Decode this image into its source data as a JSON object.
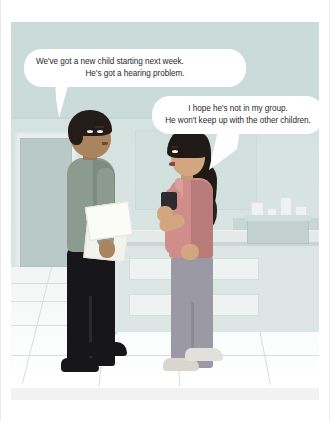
{
  "scene": {
    "title": "Two teachers talking in a staff room",
    "type": "illustration-comic-panel",
    "setting": "school staff room with counter, cabinet drawers, notice board and tiled floor"
  },
  "speech_bubbles": [
    {
      "id": "bubble-1",
      "speaker": "man",
      "tail_direction": "down-left",
      "lines": [
        "We've got a new child starting next week.",
        "He's got a hearing problem."
      ]
    },
    {
      "id": "bubble-2",
      "speaker": "woman",
      "tail_direction": "down-left",
      "lines": [
        "I hope he's not in my group.",
        "He won't keep up with the other children."
      ]
    }
  ],
  "characters": [
    {
      "id": "man",
      "description": "man facing right",
      "hair": "short dark",
      "top": "grey-green long sleeve shirt",
      "bottom": "black trousers",
      "shoes": "black shoes",
      "holding": "sheets of white paper"
    },
    {
      "id": "woman",
      "description": "woman facing left",
      "hair": "dark with fringe and ponytail",
      "top": "dusty pink sleeveless top",
      "bottom": "grey-purple trousers",
      "shoes": "light grey shoes",
      "holding": "dark coffee mug"
    }
  ],
  "background": {
    "wall_color": "#d4e2e0",
    "floor": "white tiled floor with grid lines",
    "door_panel": "framed panel on far left wall",
    "notice_board": "pale board on back wall",
    "counter": "light counter unit with two drawers",
    "basket": "tray of supplies on counter top"
  },
  "colors": {
    "wall": "#d4e2e0",
    "wall_upper": "#cadbd9",
    "floor": "#fbfcfc",
    "bubble_fill": "#ffffff",
    "bubble_text": "#2a2a2a",
    "man_shirt": "#8b9b8f",
    "man_trousers": "#17171a",
    "man_skin": "#a9845f",
    "woman_top": "#cf8d8b",
    "woman_trousers": "#9b9aa4",
    "woman_skin": "#d2a67f",
    "hair_dark": "#201a17",
    "counter": "#dde6e4",
    "mug": "#2b2b30"
  }
}
